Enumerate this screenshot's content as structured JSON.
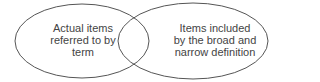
{
  "diagram": {
    "type": "venn",
    "circles": [
      {
        "id": "left",
        "label": "Actual items referred to by term",
        "lines": [
          "Actual items",
          "referred to by",
          "term"
        ]
      },
      {
        "id": "right",
        "label": "Items included by the broad and narrow definition",
        "lines": [
          "Items included",
          "by the broad and",
          "narrow definition"
        ]
      }
    ],
    "stroke_color": "#555555"
  }
}
